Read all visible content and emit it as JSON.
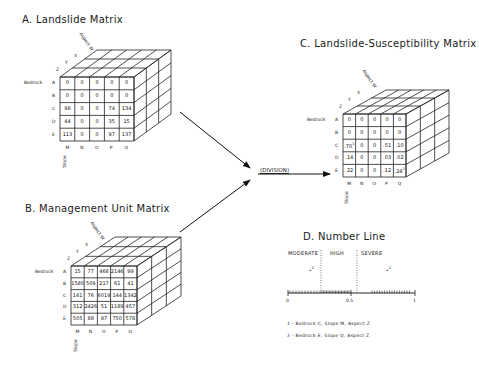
{
  "panels": {
    "A": {
      "title": "A. Landslide Matrix",
      "aspect_label": "Aspect W",
      "aspect_ticks": [
        "Z",
        "Y",
        "X"
      ],
      "bedrock_label": "Bedrock",
      "rows": [
        "A",
        "B",
        "C",
        "D",
        "E"
      ],
      "slope_label": "Slope",
      "slope_ticks": [
        "M",
        "N",
        "O",
        "P",
        "Q"
      ],
      "values": [
        [
          "0",
          "0",
          "0",
          "0",
          "0"
        ],
        [
          "0",
          "0",
          "0",
          "0",
          "0"
        ],
        [
          "98",
          "0",
          "0",
          "74",
          "134"
        ],
        [
          "44",
          "0",
          "0",
          "35",
          "15"
        ],
        [
          "113",
          "0",
          "0",
          "97",
          "137"
        ]
      ]
    },
    "B": {
      "title": "B. Management Unit Matrix",
      "aspect_label": "Aspect W",
      "aspect_ticks": [
        "Z",
        "Y",
        "X"
      ],
      "bedrock_label": "Bedrock",
      "rows": [
        "A",
        "B",
        "C",
        "D",
        "E"
      ],
      "slope_label": "Slope",
      "slope_ticks": [
        "M",
        "N",
        "O",
        "P",
        "Q"
      ],
      "values": [
        [
          "15",
          "77",
          "468",
          "2146",
          "99"
        ],
        [
          "1580",
          "509",
          "217",
          "61",
          "41"
        ],
        [
          "141",
          "76",
          "6019",
          "144",
          "1342"
        ],
        [
          "312",
          "2426",
          "51",
          "1189",
          "457"
        ],
        [
          "505",
          "88",
          "97",
          "750",
          "578"
        ]
      ]
    },
    "C": {
      "title": "C. Landslide-Susceptibility Matrix",
      "aspect_label": "Aspect W",
      "aspect_ticks": [
        "Z",
        "Y",
        "X"
      ],
      "bedrock_label": "Bedrock",
      "rows": [
        "A",
        "B",
        "C",
        "D",
        "E"
      ],
      "slope_label": "Slope",
      "slope_ticks": [
        "M",
        "N",
        "O",
        "P",
        "Q"
      ],
      "values": [
        [
          "0",
          "0",
          "0",
          "0",
          "0"
        ],
        [
          "0",
          "0",
          "0",
          "0",
          "0"
        ],
        [
          ".70",
          "0",
          "0",
          ".51",
          ".10"
        ],
        [
          ".14",
          "0",
          "0",
          ".03",
          ".02"
        ],
        [
          ".22",
          "0",
          "0",
          ".12",
          ".24"
        ]
      ],
      "marks": {
        "c0": "1",
        "e4": "2"
      }
    },
    "D": {
      "title": "D. Number Line",
      "categories": [
        "MODERATE",
        "HIGH",
        "SEVERE"
      ],
      "ticks": [
        "0",
        "0.5",
        "1"
      ],
      "points": [
        {
          "label": "2",
          "value": 0.18
        },
        {
          "label": "1",
          "value": 0.7
        }
      ],
      "footnotes": [
        "1 - Bedrock C, Slope M, Aspect Z",
        "2 - Bedrock E, Slope Q, Aspect Z"
      ]
    }
  },
  "operation_label": "(DIVISION)"
}
